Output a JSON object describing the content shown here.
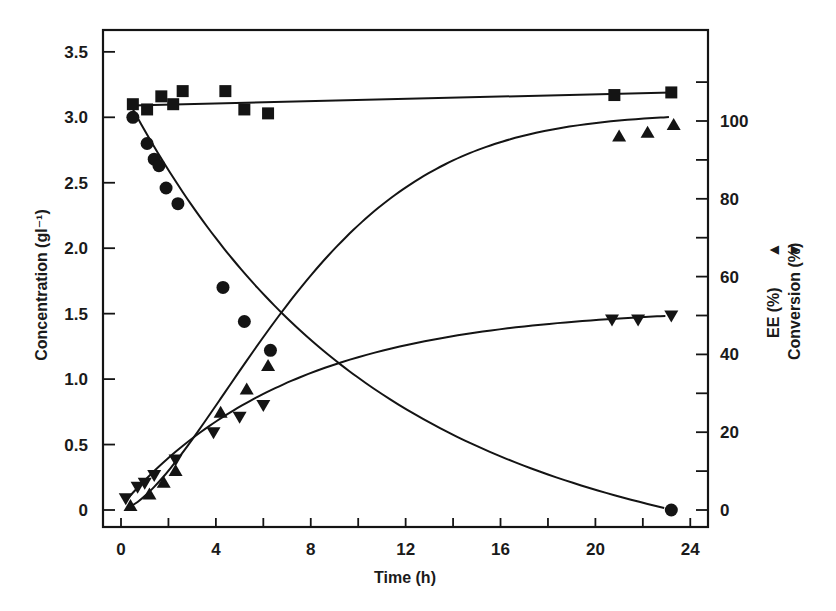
{
  "chart_data": {
    "type": "scatter",
    "title": "",
    "xlabel": "Time (h)",
    "ylabel": "Concentration (gl⁻¹)",
    "ylabel_right": [
      "EE (%)",
      "Conversion (%)"
    ],
    "right_axis_markers": [
      "▲",
      "▼"
    ],
    "xlim": [
      0,
      24.5
    ],
    "ylim": [
      0,
      3.5
    ],
    "ylim_right": [
      0,
      100
    ],
    "grid": false,
    "legend": "none",
    "x_ticks": [
      0,
      4,
      8,
      12,
      16,
      20,
      24
    ],
    "x_tick_labels": [
      "0",
      "4",
      "8",
      "12",
      "16",
      "20",
      "24"
    ],
    "y_ticks": [
      0,
      0.5,
      1.0,
      1.5,
      2.0,
      2.5,
      3.0,
      3.5
    ],
    "y_tick_labels": [
      "0",
      "0.5",
      "1.0",
      "1.5",
      "2.0",
      "2.5",
      "3.0",
      "3.5"
    ],
    "y_right_ticks": [
      0,
      20,
      40,
      60,
      80,
      100
    ],
    "y_right_tick_labels": [
      "0",
      "20",
      "40",
      "60",
      "80",
      "100"
    ],
    "series": [
      {
        "name": "Concentration (squares)",
        "marker": "square",
        "axis": "left",
        "x": [
          0.5,
          1.1,
          1.7,
          2.2,
          2.6,
          4.4,
          5.2,
          6.2,
          20.8,
          23.2
        ],
        "values": [
          3.1,
          3.06,
          3.16,
          3.1,
          3.2,
          3.2,
          3.06,
          3.03,
          3.17,
          3.19
        ],
        "fit": {
          "x": [
            0.5,
            23.2
          ],
          "y": [
            3.09,
            3.19
          ]
        }
      },
      {
        "name": "Concentration (circles)",
        "marker": "circle",
        "axis": "left",
        "x": [
          0.5,
          1.1,
          1.4,
          1.6,
          1.9,
          2.4,
          4.3,
          5.2,
          6.3,
          23.2
        ],
        "values": [
          3.0,
          2.8,
          2.68,
          2.63,
          2.46,
          2.34,
          1.7,
          1.44,
          1.22,
          0.0
        ]
      },
      {
        "name": "EE (%)",
        "marker": "triangle-up",
        "axis": "right",
        "x": [
          0.4,
          1.2,
          1.8,
          2.3,
          4.2,
          5.3,
          6.2,
          21.0,
          22.2,
          23.3
        ],
        "values": [
          1,
          4,
          7,
          10,
          25,
          31,
          37,
          96,
          97,
          99
        ]
      },
      {
        "name": "Conversion (%)",
        "marker": "triangle-down",
        "axis": "right",
        "x": [
          0.2,
          0.7,
          1.0,
          1.4,
          2.3,
          3.9,
          5.0,
          6.0,
          20.7,
          21.8,
          23.2
        ],
        "values": [
          3,
          6,
          7,
          9,
          13,
          20,
          24,
          27,
          49,
          49,
          50
        ]
      }
    ]
  },
  "colors": {
    "ink": "#141414",
    "background": "#ffffff"
  }
}
